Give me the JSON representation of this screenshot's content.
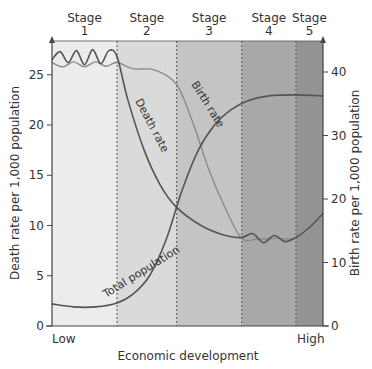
{
  "chart_data": {
    "type": "line",
    "xlabel": "Economic development",
    "x_tick_labels": {
      "low": "Low",
      "high": "High"
    },
    "ylabel_left": "Death rate per 1,000 population",
    "ylabel_right": "Birth rate per 1,000 population",
    "ylim_left": [
      0,
      27.5
    ],
    "ylim_right": [
      0,
      43.5
    ],
    "yticks_left": [
      0,
      5,
      10,
      15,
      20,
      25
    ],
    "yticks_right": [
      0,
      10,
      20,
      30,
      40
    ],
    "stages": [
      {
        "label_top": "Stage",
        "label_num": "1",
        "x_start": 0,
        "x_end": 0.24,
        "color": "#ececec"
      },
      {
        "label_top": "Stage",
        "label_num": "2",
        "x_start": 0.24,
        "x_end": 0.46,
        "color": "#dadada"
      },
      {
        "label_top": "Stage",
        "label_num": "3",
        "x_start": 0.46,
        "x_end": 0.7,
        "color": "#c4c4c4"
      },
      {
        "label_top": "Stage",
        "label_num": "4",
        "x_start": 0.7,
        "x_end": 0.9,
        "color": "#a9a9a9"
      },
      {
        "label_top": "Stage",
        "label_num": "5",
        "x_start": 0.9,
        "x_end": 1.0,
        "color": "#949494"
      }
    ],
    "series": [
      {
        "name": "Death rate",
        "axis": "left",
        "color": "#555555",
        "x": [
          0,
          0.03,
          0.06,
          0.09,
          0.12,
          0.15,
          0.18,
          0.21,
          0.24,
          0.28,
          0.34,
          0.4,
          0.46,
          0.55,
          0.64,
          0.7,
          0.74,
          0.78,
          0.82,
          0.86,
          0.9,
          0.95,
          1.0
        ],
        "values": [
          26.5,
          27.3,
          26.2,
          27.4,
          26.0,
          27.5,
          26.1,
          27.4,
          26.8,
          22.5,
          17.5,
          14.0,
          11.8,
          10.0,
          9.0,
          8.8,
          9.2,
          8.3,
          9.0,
          8.4,
          8.8,
          9.8,
          11.2
        ]
      },
      {
        "name": "Birth rate",
        "axis": "right",
        "color": "#8a8a8a",
        "x": [
          0,
          0.04,
          0.08,
          0.12,
          0.16,
          0.2,
          0.24,
          0.3,
          0.38,
          0.46,
          0.52,
          0.58,
          0.64,
          0.7,
          0.76,
          0.82,
          0.88,
          0.9
        ],
        "values": [
          41.5,
          40.8,
          41.6,
          40.8,
          41.6,
          40.9,
          41.5,
          40.5,
          40.3,
          38.0,
          32.0,
          24.5,
          18.5,
          13.8,
          13.7,
          13.8,
          13.7,
          13.8
        ]
      },
      {
        "name": "Total population",
        "axis": "left",
        "color": "#555555",
        "x": [
          0,
          0.08,
          0.16,
          0.24,
          0.3,
          0.36,
          0.42,
          0.48,
          0.54,
          0.6,
          0.66,
          0.72,
          0.8,
          0.9,
          1.0
        ],
        "values": [
          2.2,
          1.9,
          1.9,
          2.3,
          3.2,
          5.0,
          8.5,
          13.5,
          17.5,
          20.0,
          21.5,
          22.4,
          22.9,
          23.0,
          22.9
        ]
      }
    ],
    "curve_labels": {
      "death": "Death rate",
      "birth": "Birth rate",
      "population": "Total population"
    },
    "grid": false,
    "legend": "inline labels"
  }
}
